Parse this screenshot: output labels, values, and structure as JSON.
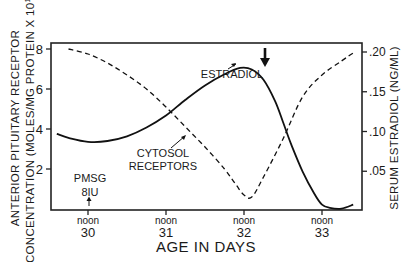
{
  "chart_data": {
    "type": "line",
    "title": "",
    "xlabel": "AGE IN DAYS",
    "ylabel": "ANTERIOR PITUITARY RECEPTOR CONCENTRATION (MOLES/MG PROTEIN X 10^14)",
    "ylabel_lines": [
      "ANTERIOR PITUITARY RECEPTOR",
      "CONCENTRATION (MOLES/MG PROTEIN X 10"
    ],
    "ylabel_exp": "14",
    "ylabel_close": ")",
    "y2label": "SERUM ESTRADIOL (NG/ML)",
    "x_ticks": [
      {
        "top": "noon",
        "bottom": "30",
        "x": 30
      },
      {
        "top": "noon",
        "bottom": "31",
        "x": 31
      },
      {
        "top": "noon",
        "bottom": "32",
        "x": 32
      },
      {
        "top": "noon",
        "bottom": "33",
        "x": 33
      }
    ],
    "xlim": [
      29.6,
      33.5
    ],
    "ylim": [
      0,
      8.2
    ],
    "y_ticks": [
      "2",
      "4",
      "6",
      "8"
    ],
    "y2lim": [
      0,
      0.205
    ],
    "y2_ticks": [
      ".05",
      ".10",
      ".15",
      ".20"
    ],
    "grid": false,
    "series": [
      {
        "name": "CYTOSOL RECEPTORS",
        "axis": "left",
        "style": "dashed",
        "x": [
          29.75,
          30.0,
          30.25,
          30.5,
          30.75,
          31.0,
          31.25,
          31.5,
          31.75,
          31.9,
          32.0,
          32.1,
          32.25,
          32.5,
          32.75,
          33.0,
          33.25,
          33.4
        ],
        "y": [
          8.0,
          7.75,
          7.3,
          6.7,
          6.0,
          5.1,
          4.1,
          3.1,
          2.0,
          1.2,
          0.7,
          0.6,
          1.6,
          3.5,
          5.6,
          6.7,
          7.4,
          7.8
        ]
      },
      {
        "name": "ESTRADIOL",
        "axis": "right",
        "style": "solid",
        "x": [
          29.6,
          29.75,
          30.0,
          30.25,
          30.5,
          30.75,
          31.0,
          31.25,
          31.5,
          31.75,
          31.95,
          32.1,
          32.25,
          32.4,
          32.5,
          32.6,
          32.75,
          32.9,
          33.0,
          33.1,
          33.25,
          33.4
        ],
        "y": [
          0.097,
          0.092,
          0.087,
          0.088,
          0.094,
          0.105,
          0.12,
          0.14,
          0.158,
          0.172,
          0.18,
          0.178,
          0.165,
          0.138,
          0.112,
          0.085,
          0.05,
          0.022,
          0.008,
          0.004,
          0.003,
          0.008
        ]
      }
    ],
    "annotations": [
      {
        "text": "ESTRADIOL",
        "x": 31.75,
        "y_px": 78
      },
      {
        "text": "CYTOSOL",
        "x": 31.05,
        "y_px": 150
      },
      {
        "text": "RECEPTORS",
        "x": 31.05,
        "y_px": 166
      },
      {
        "text": "PMSG",
        "x": 29.8,
        "y_px": 182
      },
      {
        "text": "8IU",
        "x": 29.8,
        "y_px": 195
      },
      {
        "text": "bold down arrow",
        "x": 32.28,
        "y_px": 55
      }
    ]
  }
}
